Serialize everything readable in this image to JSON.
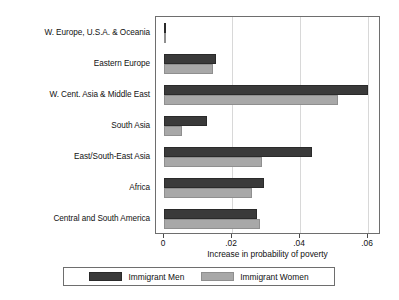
{
  "chart_data": {
    "type": "bar",
    "orientation": "horizontal",
    "title": "",
    "xlabel": "Increase in probability of poverty",
    "ylabel": "",
    "xlim": [
      0,
      0.0654
    ],
    "xticks": [
      0,
      0.02,
      0.04,
      0.06
    ],
    "xticklabels": [
      "0",
      ".02",
      ".04",
      ".06"
    ],
    "grid": "vertical",
    "legend_position": "bottom",
    "categories": [
      "W. Europe, U.S.A. & Oceania",
      "Eastern Europe",
      "W. Cent. Asia & Middle East",
      "South Asia",
      "East/South-East Asia",
      "Africa",
      "Central and South America"
    ],
    "series": [
      {
        "name": "Immigrant Men",
        "color": "#3a3a3a",
        "values": [
          0.0005,
          0.0153,
          0.06,
          0.0126,
          0.0435,
          0.0294,
          0.0274
        ]
      },
      {
        "name": "Immigrant Women",
        "color": "#a8a8a8",
        "values": [
          0.0003,
          0.0145,
          0.0512,
          0.0053,
          0.0288,
          0.0259,
          0.0282
        ]
      }
    ]
  },
  "legend": {
    "items": [
      {
        "label": "Immigrant Men"
      },
      {
        "label": "Immigrant Women"
      }
    ]
  }
}
